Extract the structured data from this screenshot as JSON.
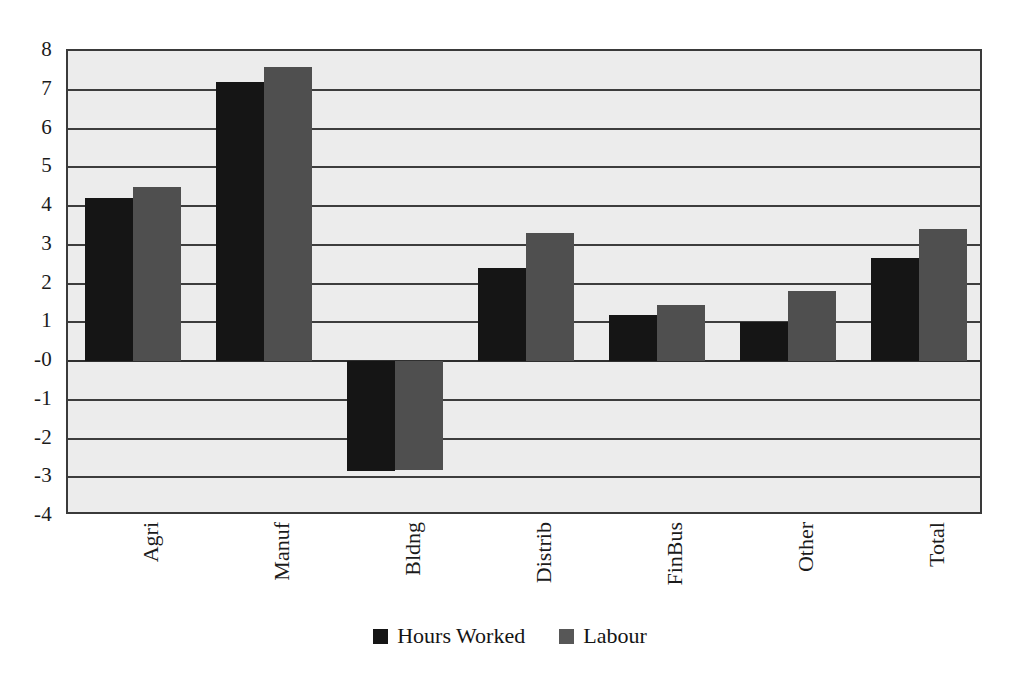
{
  "chart_data": {
    "type": "bar",
    "title": "",
    "subtitle": "",
    "xlabel": "",
    "ylabel": "",
    "categories": [
      "Agri",
      "Manuf",
      "Bldng",
      "Distrib",
      "FinBus",
      "Other",
      "Total"
    ],
    "series": [
      {
        "name": "Hours Worked",
        "color": "#151515",
        "values": [
          4.2,
          7.2,
          -2.85,
          2.4,
          1.2,
          1.0,
          2.65
        ]
      },
      {
        "name": "Labour",
        "color": "#4f4f4f",
        "values": [
          4.5,
          7.6,
          -2.8,
          3.3,
          1.45,
          1.8,
          3.4
        ]
      }
    ],
    "ylim": [
      -4,
      8
    ],
    "ytick_labels": [
      "8",
      "7",
      "6",
      "5",
      "4",
      "3",
      "2",
      "1",
      "-0",
      "-1",
      "-2",
      "-3",
      "-4"
    ],
    "ytick_values": [
      8,
      7,
      6,
      5,
      4,
      3,
      2,
      1,
      0,
      -1,
      -2,
      -3,
      -4
    ],
    "grid": true,
    "grid_axis": "y",
    "legend_position": "bottom",
    "xtick_rotation": -90,
    "plot_background": "#ececec",
    "axis_color": "#3a3a3a"
  }
}
